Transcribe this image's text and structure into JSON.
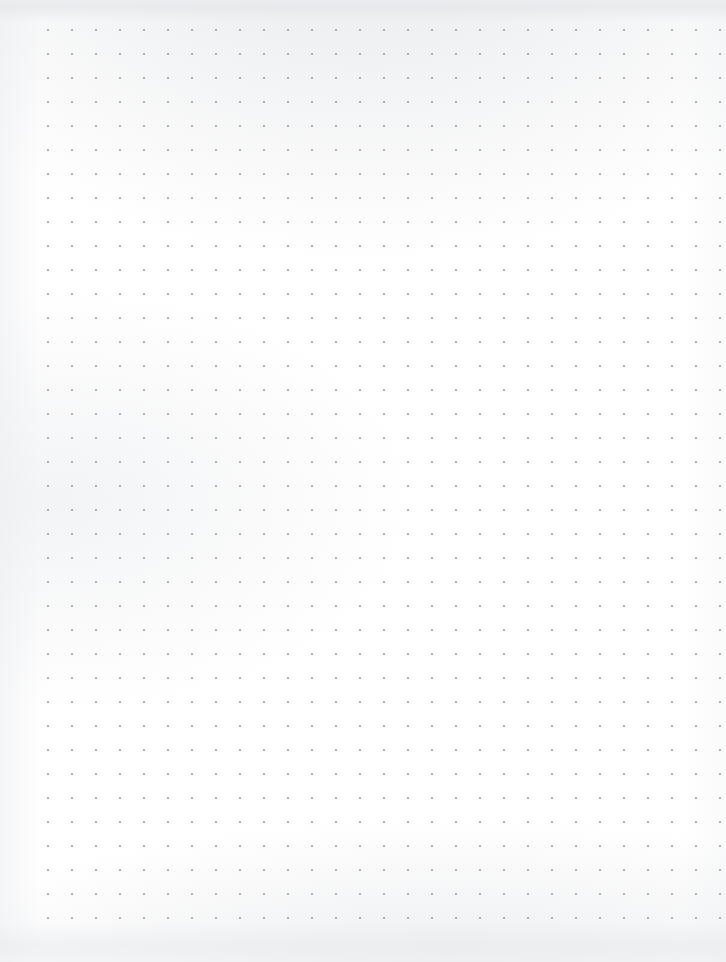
{
  "page": {
    "kind": "dot-grid-paper",
    "width_px": 726,
    "height_px": 962,
    "background_color": "#ffffff",
    "has_text": false,
    "has_handwriting": false,
    "content_summary": "Empty dot-grid (bullet journal) paper page — no text, no drawings, no UI controls."
  },
  "grid": {
    "dot_color": "#a6a8ac",
    "dot_size_px": 2,
    "spacing_px": 24,
    "origin_x_px": 47,
    "origin_y_px": 29,
    "columns": 29,
    "rows": 38,
    "column_x_positions": [
      47,
      71,
      95,
      119,
      143,
      167,
      191,
      215,
      239,
      263,
      287,
      311,
      335,
      359,
      383,
      407,
      431,
      455,
      479,
      503,
      527,
      551,
      575,
      599,
      623,
      647,
      671,
      695,
      719
    ],
    "row_y_positions": [
      29,
      53,
      77,
      101,
      125,
      149,
      173,
      197,
      221,
      245,
      269,
      293,
      317,
      341,
      365,
      389,
      413,
      437,
      461,
      485,
      509,
      533,
      557,
      581,
      605,
      629,
      653,
      677,
      701,
      725,
      749,
      773,
      797,
      821,
      845,
      869,
      893,
      917
    ]
  },
  "margins": {
    "left_px": 47,
    "right_px": 7,
    "top_px": 29,
    "bottom_px": 45
  },
  "texture": {
    "top_shade_color": "#e4e6e9",
    "bottom_shade_color": "#e8eaed",
    "left_edge_color": "#f4f5f7",
    "right_edge_color": "#f8f9fa"
  }
}
